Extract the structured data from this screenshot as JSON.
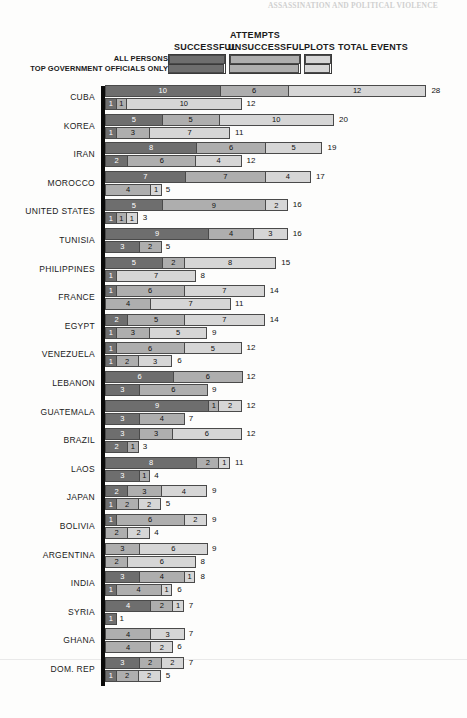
{
  "running_head": "ASSASSINATION AND POLITICAL VIOLENCE",
  "legend": {
    "attempts_title": "ATTEMPTS",
    "col_successful": "SUCCESSFUL",
    "col_unsuccessful": "UNSUCCESSFUL",
    "col_plots": "PLOTS",
    "col_total": "TOTAL EVENTS",
    "row_all_persons": "ALL PERSONS",
    "row_top_officials": "TOP GOVERNMENT OFFICIALS ONLY"
  },
  "colors": {
    "successful": "#6e6e6e",
    "unsuccessful": "#aeaeae",
    "plots": "#d6d6d6",
    "axis": "#0a0a0a",
    "outline": "#4a4a4a",
    "page_background": "#fdfdfc"
  },
  "chart_data": {
    "type": "bar",
    "orientation": "horizontal",
    "stacked": true,
    "title": "ATTEMPTS",
    "xlabel": "",
    "ylabel": "",
    "xlim": [
      0,
      28
    ],
    "grid": false,
    "legend_position": "top",
    "series": [
      {
        "name": "SUCCESSFUL",
        "key": "successful",
        "color": "#6e6e6e"
      },
      {
        "name": "UNSUCCESSFUL",
        "key": "unsuccessful",
        "color": "#aeaeae"
      },
      {
        "name": "PLOTS",
        "key": "plots",
        "color": "#d6d6d6"
      }
    ],
    "row_kinds": [
      {
        "name": "ALL PERSONS",
        "key": "all_persons"
      },
      {
        "name": "TOP GOVERNMENT OFFICIALS ONLY",
        "key": "top_officials"
      }
    ],
    "categories": [
      "CUBA",
      "KOREA",
      "IRAN",
      "MOROCCO",
      "UNITED STATES",
      "TUNISIA",
      "PHILIPPINES",
      "FRANCE",
      "EGYPT",
      "VENEZUELA",
      "LEBANON",
      "GUATEMALA",
      "BRAZIL",
      "LAOS",
      "JAPAN",
      "BOLIVIA",
      "ARGENTINA",
      "INDIA",
      "SYRIA",
      "GHANA",
      "DOM. REP"
    ],
    "rows": [
      {
        "country": "CUBA",
        "all_persons": {
          "successful": 10,
          "unsuccessful": 6,
          "plots": 12,
          "total": 28
        },
        "top_officials": {
          "successful": 1,
          "unsuccessful": 1,
          "plots": 10,
          "total": 12
        }
      },
      {
        "country": "KOREA",
        "all_persons": {
          "successful": 5,
          "unsuccessful": 5,
          "plots": 10,
          "total": 20
        },
        "top_officials": {
          "successful": 1,
          "unsuccessful": 3,
          "plots": 7,
          "total": 11
        }
      },
      {
        "country": "IRAN",
        "all_persons": {
          "successful": 8,
          "unsuccessful": 6,
          "plots": 5,
          "total": 19
        },
        "top_officials": {
          "successful": 2,
          "unsuccessful": 6,
          "plots": 4,
          "total": 12
        }
      },
      {
        "country": "MOROCCO",
        "all_persons": {
          "successful": 7,
          "unsuccessful": 7,
          "plots": 4,
          "total": 17
        },
        "top_officials": {
          "successful": 0,
          "unsuccessful": 4,
          "plots": 1,
          "total": 5
        }
      },
      {
        "country": "UNITED STATES",
        "all_persons": {
          "successful": 5,
          "unsuccessful": 9,
          "plots": 2,
          "total": 16
        },
        "top_officials": {
          "successful": 1,
          "unsuccessful": 1,
          "plots": 1,
          "total": 3
        }
      },
      {
        "country": "TUNISIA",
        "all_persons": {
          "successful": 9,
          "unsuccessful": 4,
          "plots": 3,
          "total": 16
        },
        "top_officials": {
          "successful": 3,
          "unsuccessful": 2,
          "plots": 0,
          "total": 5
        }
      },
      {
        "country": "PHILIPPINES",
        "all_persons": {
          "successful": 5,
          "unsuccessful": 2,
          "plots": 8,
          "total": 15
        },
        "top_officials": {
          "successful": 1,
          "unsuccessful": 0,
          "plots": 7,
          "total": 8
        }
      },
      {
        "country": "FRANCE",
        "all_persons": {
          "successful": 1,
          "unsuccessful": 6,
          "plots": 7,
          "total": 14
        },
        "top_officials": {
          "successful": 0,
          "unsuccessful": 4,
          "plots": 7,
          "total": 11
        }
      },
      {
        "country": "EGYPT",
        "all_persons": {
          "successful": 2,
          "unsuccessful": 5,
          "plots": 7,
          "total": 14
        },
        "top_officials": {
          "successful": 1,
          "unsuccessful": 3,
          "plots": 5,
          "total": 9
        }
      },
      {
        "country": "VENEZUELA",
        "all_persons": {
          "successful": 1,
          "unsuccessful": 6,
          "plots": 5,
          "total": 12
        },
        "top_officials": {
          "successful": 1,
          "unsuccessful": 2,
          "plots": 3,
          "total": 6
        }
      },
      {
        "country": "LEBANON",
        "all_persons": {
          "successful": 6,
          "unsuccessful": 6,
          "plots": 0,
          "total": 12
        },
        "top_officials": {
          "successful": 3,
          "unsuccessful": 6,
          "plots": 0,
          "total": 9
        }
      },
      {
        "country": "GUATEMALA",
        "all_persons": {
          "successful": 9,
          "unsuccessful": 1,
          "plots": 2,
          "total": 12
        },
        "top_officials": {
          "successful": 3,
          "unsuccessful": 4,
          "plots": 0,
          "total": 7
        }
      },
      {
        "country": "BRAZIL",
        "all_persons": {
          "successful": 3,
          "unsuccessful": 3,
          "plots": 6,
          "total": 12
        },
        "top_officials": {
          "successful": 2,
          "unsuccessful": 1,
          "plots": 0,
          "total": 3
        }
      },
      {
        "country": "LAOS",
        "all_persons": {
          "successful": 8,
          "unsuccessful": 2,
          "plots": 1,
          "total": 11
        },
        "top_officials": {
          "successful": 3,
          "unsuccessful": 1,
          "plots": 0,
          "total": 4
        }
      },
      {
        "country": "JAPAN",
        "all_persons": {
          "successful": 2,
          "unsuccessful": 3,
          "plots": 4,
          "total": 9
        },
        "top_officials": {
          "successful": 1,
          "unsuccessful": 2,
          "plots": 2,
          "total": 5
        }
      },
      {
        "country": "BOLIVIA",
        "all_persons": {
          "successful": 1,
          "unsuccessful": 6,
          "plots": 2,
          "total": 9
        },
        "top_officials": {
          "successful": 0,
          "unsuccessful": 2,
          "plots": 2,
          "total": 4
        }
      },
      {
        "country": "ARGENTINA",
        "all_persons": {
          "successful": 0,
          "unsuccessful": 3,
          "plots": 6,
          "total": 9
        },
        "top_officials": {
          "successful": 0,
          "unsuccessful": 2,
          "plots": 6,
          "total": 8
        }
      },
      {
        "country": "INDIA",
        "all_persons": {
          "successful": 3,
          "unsuccessful": 4,
          "plots": 1,
          "total": 8
        },
        "top_officials": {
          "successful": 1,
          "unsuccessful": 4,
          "plots": 1,
          "total": 6
        }
      },
      {
        "country": "SYRIA",
        "all_persons": {
          "successful": 4,
          "unsuccessful": 2,
          "plots": 1,
          "total": 7
        },
        "top_officials": {
          "successful": 1,
          "unsuccessful": 0,
          "plots": 0,
          "total": 1
        }
      },
      {
        "country": "GHANA",
        "all_persons": {
          "successful": 0,
          "unsuccessful": 4,
          "plots": 3,
          "total": 7
        },
        "top_officials": {
          "successful": 0,
          "unsuccessful": 4,
          "plots": 2,
          "total": 6
        }
      },
      {
        "country": "DOM. REP",
        "all_persons": {
          "successful": 3,
          "unsuccessful": 2,
          "plots": 2,
          "total": 7
        },
        "top_officials": {
          "successful": 1,
          "unsuccessful": 2,
          "plots": 2,
          "total": 5
        }
      }
    ]
  }
}
